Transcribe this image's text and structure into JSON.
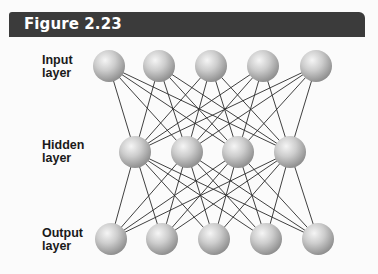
{
  "figure": {
    "title": "Figure 2.23",
    "header_color": "#3b3b3b",
    "background_color": "#fbfbfb"
  },
  "layers": [
    {
      "id": "input",
      "label_line1": "Input",
      "label_line2": "layer",
      "label_x": 42,
      "label_y": 54,
      "node_count": 5,
      "node_y": 66,
      "node_x": [
        109,
        159,
        211,
        263,
        316
      ]
    },
    {
      "id": "hidden",
      "label_line1": "Hidden",
      "label_line2": "layer",
      "label_x": 42,
      "label_y": 139,
      "node_count": 4,
      "node_y": 152,
      "node_x": [
        135,
        187,
        238,
        290
      ]
    },
    {
      "id": "output",
      "label_line1": "Output",
      "label_line2": "layer",
      "label_x": 42,
      "label_y": 227,
      "node_count": 5,
      "node_y": 239,
      "node_x": [
        111,
        162,
        214,
        266,
        318
      ]
    }
  ],
  "node": {
    "radius": 16,
    "fill_light": "#f2f2f2",
    "fill_mid": "#c4c4c4",
    "fill_dark": "#8e8e8e"
  },
  "edges": {
    "topology": "fully-connected",
    "color": "#2a2a2a",
    "width": 0.9
  }
}
